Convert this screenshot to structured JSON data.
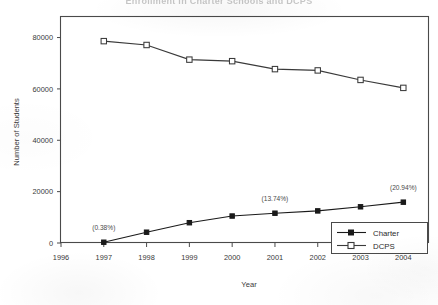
{
  "chart_data": {
    "type": "line",
    "title": "Enrollment in Charter Schools and DCPS",
    "title_visibility": "cropped-at-top-edge",
    "xlabel": "Year",
    "ylabel": "Number of Students",
    "x": [
      1997,
      1998,
      1999,
      2000,
      2001,
      2002,
      2003,
      2004
    ],
    "xlim": [
      1996,
      2004.6
    ],
    "xticks": [
      1996,
      1997,
      1998,
      1999,
      2000,
      2001,
      2002,
      2003,
      2004
    ],
    "xticklabels": [
      "1996",
      "1997",
      "1998",
      "1999",
      "2000",
      "2001",
      "2002",
      "2003",
      "2004"
    ],
    "ylim": [
      0,
      88000
    ],
    "yticks": [
      0,
      20000,
      40000,
      60000,
      80000
    ],
    "yticklabels": [
      "0",
      "20000",
      "40000",
      "60000",
      "80000"
    ],
    "grid": false,
    "legend_position": "lower-right-inside",
    "series": [
      {
        "name": "Charter",
        "marker": "filled-square",
        "color": "#1a1a1a",
        "values": [
          300,
          4200,
          7900,
          10500,
          11600,
          12500,
          14100,
          15900
        ]
      },
      {
        "name": "DCPS",
        "marker": "open-square",
        "color": "#3a3a3a",
        "values": [
          78600,
          77100,
          71400,
          70800,
          67700,
          67200,
          63500,
          60400
        ]
      }
    ],
    "annotations": [
      {
        "text": "(0.38%)",
        "x": 1997,
        "series": "Charter"
      },
      {
        "text": "(13.74%)",
        "x": 2001,
        "series": "Charter"
      },
      {
        "text": "(20.94%)",
        "x": 2004,
        "series": "Charter"
      }
    ]
  },
  "legend": {
    "entries": [
      {
        "label": "Charter"
      },
      {
        "label": "DCPS"
      }
    ]
  }
}
